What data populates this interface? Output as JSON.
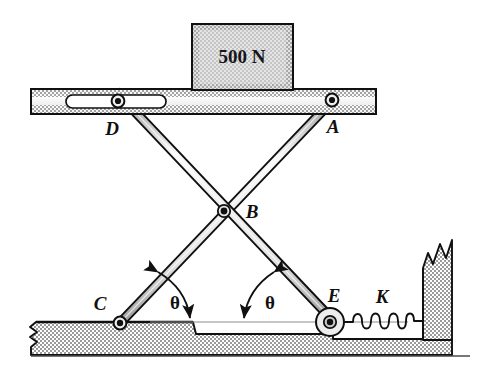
{
  "figure": {
    "background_color": "#ffffff",
    "ink_color": "#101010",
    "fill_gray": "#d8d8d8",
    "hatch_gray": "#b9b9b9",
    "bar_fill": "#e6e6e6",
    "width": 487,
    "height": 379
  },
  "load": {
    "label": "500 N",
    "shape": "rectangular-block",
    "fill": "#cfcfcf"
  },
  "labels": {
    "point_a": "A",
    "point_b": "B",
    "point_c": "C",
    "point_d": "D",
    "point_e": "E",
    "spring": "K",
    "angle_left": "θ",
    "angle_right": "θ"
  },
  "components": {
    "platform": "top-platform-with-slot",
    "link_de": "link-D-to-E",
    "link_ac": "link-A-to-C",
    "pin_b": "center-pin-B",
    "pin_a": "fixed-pin-A",
    "slider_d": "slot-slider-D",
    "pin_c": "fixed-pin-C",
    "roller_e": "roller-E",
    "spring_k": "coil-spring-K",
    "ground": "hatched-ground-with-step",
    "wall": "right-hatched-wall"
  },
  "spring": {
    "coil_count": 7
  },
  "geometry": {
    "point_a": [
      330,
      98
    ],
    "point_b": [
      223,
      210
    ],
    "point_c": [
      117,
      322
    ],
    "point_d": [
      118,
      100
    ],
    "point_e": [
      327,
      320
    ],
    "platform_left": 31,
    "platform_right": 376,
    "platform_top": 89,
    "platform_bottom": 113,
    "ground_line_y": 322,
    "step_x": 190
  }
}
